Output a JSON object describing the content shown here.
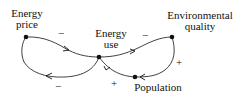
{
  "nodes": {
    "energy_price": {
      "line1": "Energy",
      "line2": "price"
    },
    "energy_use": {
      "line1": "Energy",
      "line2": "use"
    },
    "environmental_quality": {
      "line1": "Environmental",
      "line2": "quality"
    },
    "population": {
      "line1": "Population"
    }
  },
  "edges": [
    {
      "from": "Energy price",
      "to": "Energy use",
      "sign": "−"
    },
    {
      "from": "Energy use",
      "to": "Energy price",
      "sign": "−"
    },
    {
      "from": "Energy use",
      "to": "Environmental quality",
      "sign": "−"
    },
    {
      "from": "Environmental quality",
      "to": "Population",
      "sign": "+"
    },
    {
      "from": "Population",
      "to": "Energy use",
      "sign": "+"
    }
  ]
}
